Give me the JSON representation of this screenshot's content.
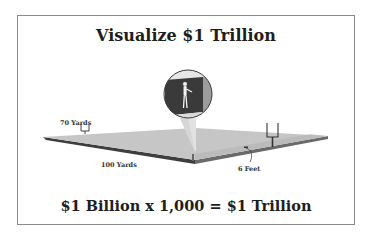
{
  "diagram": {
    "title": "Visualize $1 Trillion",
    "footer": "$1 Billion x 1,000 = $1 Trillion",
    "labels": {
      "width": "70 Yards",
      "length": "100 Yards",
      "height": "6 Feet"
    },
    "elements": {
      "field": "football-field-sized block of money",
      "goalposts": 2,
      "inset": "person standing next to block (scale reference)"
    },
    "colors": {
      "field_top": "#c4c4c4",
      "field_edge": "#4a4a4a",
      "block_dark": "#3c3c3c",
      "block_side": "#9a9a9a",
      "text": "#1e1e1e",
      "frame": "#8a8a8a"
    }
  }
}
